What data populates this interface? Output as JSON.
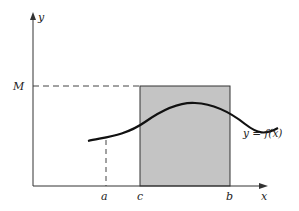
{
  "figure": {
    "labels": {
      "y_axis": "y",
      "x_axis": "x",
      "max_level": "M",
      "point_a": "a",
      "point_c": "c",
      "point_b": "b",
      "function": "y = f(x)"
    },
    "colors": {
      "axis": "#333333",
      "curve": "#111111",
      "shade": "#c4c4c4",
      "dashed": "#444444"
    }
  }
}
